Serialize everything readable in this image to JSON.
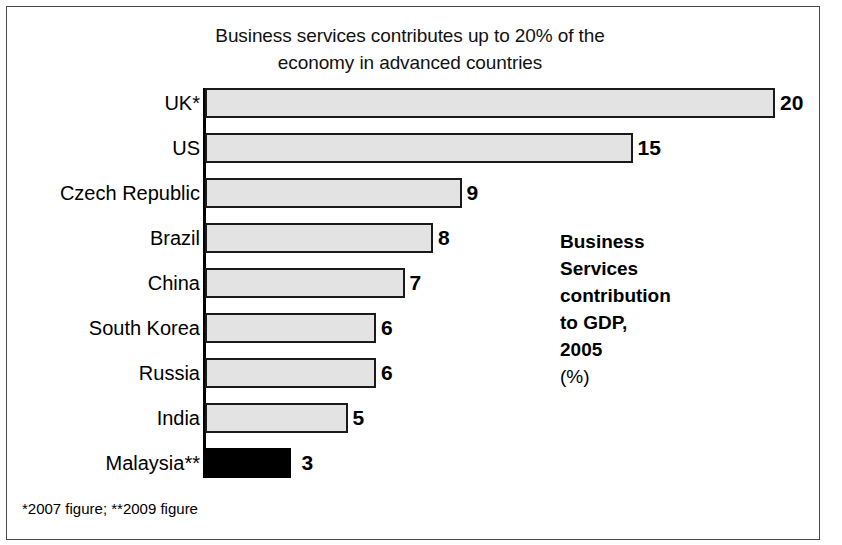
{
  "chart_data": {
    "type": "bar",
    "orientation": "horizontal",
    "title": "Business services contributes up to 20% of the economy in advanced countries",
    "xlabel": "",
    "ylabel": "",
    "xlim": [
      0,
      20
    ],
    "grid": false,
    "legend_position": "none",
    "categories": [
      "UK*",
      "US",
      "Czech Republic",
      "Brazil",
      "China",
      "South Korea",
      "Russia",
      "India",
      "Malaysia**"
    ],
    "values": [
      20,
      15,
      9,
      8,
      7,
      6,
      6,
      5,
      3
    ],
    "value_labels": [
      "20",
      "15",
      "9",
      "8",
      "7",
      "6",
      "6",
      "5",
      "3"
    ],
    "highlighted": [
      "Malaysia**"
    ],
    "annotation": "Business Services contribution to GDP, 2005",
    "annotation_unit": "(%)",
    "footnote": "*2007 figure; **2009 figure",
    "colors": {
      "bar_fill": "#e3e3e3",
      "bar_border": "#1a1a1a",
      "highlight_fill": "#000000",
      "axis": "#000000",
      "text": "#000000",
      "background": "#ffffff",
      "frame": "#4a4a4a"
    }
  },
  "title": {
    "line1": "Business services contributes up to 20% of the",
    "line2": "economy in advanced countries"
  },
  "annotation": {
    "line1": "Business",
    "line2": "Services",
    "line3": "contribution",
    "line4": "to GDP,",
    "line5": "2005",
    "unit": "(%)"
  },
  "footnote": {
    "text": "*2007 figure; **2009 figure"
  }
}
